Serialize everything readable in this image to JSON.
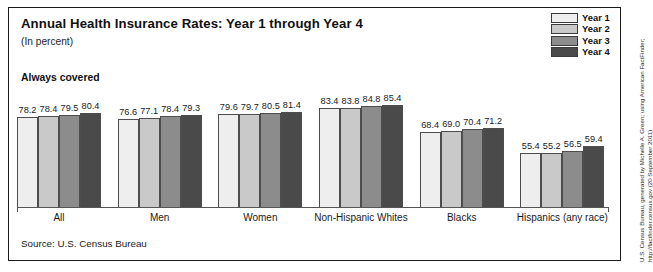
{
  "header": {
    "title": "Annual Health Insurance Rates: Year 1 through Year 4",
    "subtitle": "(In percent)",
    "series_note": "Always covered"
  },
  "legend": {
    "items": [
      {
        "label": "Year 1",
        "color": "#eeeeee"
      },
      {
        "label": "Year 2",
        "color": "#c9c9c9"
      },
      {
        "label": "Year 3",
        "color": "#8c8c8c"
      },
      {
        "label": "Year 4",
        "color": "#4a4a4a"
      }
    ]
  },
  "footer": {
    "source": "Source: U.S. Census Bureau"
  },
  "side_credit": {
    "line1": "U.S. Census Bureau, generated by Michelle A. Green; using American FactFinder;",
    "line2": "http://factfinder.census.gov (20 September 2011)"
  },
  "chart_data": {
    "type": "bar",
    "title": "Annual Health Insurance Rates: Year 1 through Year 4",
    "subtitle": "(In percent)",
    "xlabel": "",
    "ylabel": "In percent",
    "ylim": [
      0,
      100
    ],
    "grid": false,
    "legend_position": "top-right",
    "annotation": "Always covered",
    "source": "Source: U.S. Census Bureau",
    "categories": [
      "All",
      "Men",
      "Women",
      "Non-Hispanic Whites",
      "Blacks",
      "Hispanics (any race)"
    ],
    "series": [
      {
        "name": "Year 1",
        "color": "#eeeeee",
        "values": [
          78.2,
          76.6,
          79.6,
          83.4,
          68.4,
          55.4
        ]
      },
      {
        "name": "Year 2",
        "color": "#c9c9c9",
        "values": [
          78.4,
          77.1,
          79.7,
          83.8,
          69.0,
          55.2
        ]
      },
      {
        "name": "Year 3",
        "color": "#8c8c8c",
        "values": [
          79.5,
          78.4,
          80.5,
          84.8,
          70.4,
          56.5
        ]
      },
      {
        "name": "Year 4",
        "color": "#4a4a4a",
        "values": [
          80.4,
          79.3,
          81.4,
          85.4,
          71.2,
          59.4
        ]
      }
    ]
  }
}
